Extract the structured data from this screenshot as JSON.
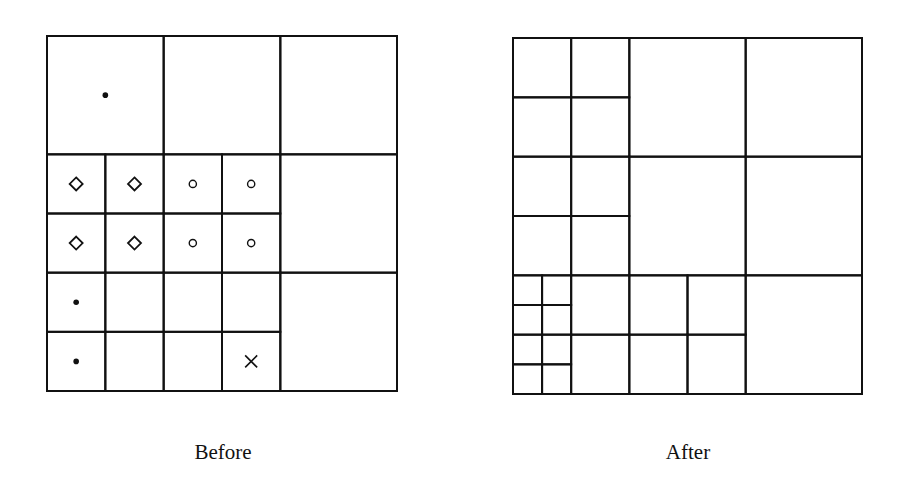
{
  "figure": {
    "panels": [
      {
        "id": "before",
        "caption": "Before",
        "frame": {
          "x": 47,
          "y": 36,
          "w": 350,
          "h": 355
        },
        "cells": [
          {
            "x": 0,
            "y": 0,
            "w": 2,
            "h": 2
          },
          {
            "x": 2,
            "y": 0,
            "w": 2,
            "h": 2
          },
          {
            "x": 4,
            "y": 0,
            "w": 2,
            "h": 2
          },
          {
            "x": 0,
            "y": 2,
            "w": 1,
            "h": 1
          },
          {
            "x": 1,
            "y": 2,
            "w": 1,
            "h": 1
          },
          {
            "x": 2,
            "y": 2,
            "w": 1,
            "h": 1
          },
          {
            "x": 3,
            "y": 2,
            "w": 1,
            "h": 1
          },
          {
            "x": 0,
            "y": 3,
            "w": 1,
            "h": 1
          },
          {
            "x": 1,
            "y": 3,
            "w": 1,
            "h": 1
          },
          {
            "x": 2,
            "y": 3,
            "w": 1,
            "h": 1
          },
          {
            "x": 3,
            "y": 3,
            "w": 1,
            "h": 1
          },
          {
            "x": 4,
            "y": 2,
            "w": 2,
            "h": 2
          },
          {
            "x": 0,
            "y": 4,
            "w": 1,
            "h": 1
          },
          {
            "x": 1,
            "y": 4,
            "w": 1,
            "h": 1
          },
          {
            "x": 2,
            "y": 4,
            "w": 1,
            "h": 1
          },
          {
            "x": 3,
            "y": 4,
            "w": 1,
            "h": 1
          },
          {
            "x": 0,
            "y": 5,
            "w": 1,
            "h": 1
          },
          {
            "x": 1,
            "y": 5,
            "w": 1,
            "h": 1
          },
          {
            "x": 2,
            "y": 5,
            "w": 1,
            "h": 1
          },
          {
            "x": 3,
            "y": 5,
            "w": 1,
            "h": 1
          },
          {
            "x": 4,
            "y": 4,
            "w": 2,
            "h": 2
          }
        ],
        "grid_units": 6,
        "markers": [
          {
            "cx": 1.0,
            "cy": 1.0,
            "shape": "dot"
          },
          {
            "cx": 0.5,
            "cy": 2.5,
            "shape": "diamond"
          },
          {
            "cx": 1.5,
            "cy": 2.5,
            "shape": "diamond"
          },
          {
            "cx": 2.5,
            "cy": 2.5,
            "shape": "circle"
          },
          {
            "cx": 3.5,
            "cy": 2.5,
            "shape": "circle"
          },
          {
            "cx": 0.5,
            "cy": 3.5,
            "shape": "diamond"
          },
          {
            "cx": 1.5,
            "cy": 3.5,
            "shape": "diamond"
          },
          {
            "cx": 2.5,
            "cy": 3.5,
            "shape": "circle"
          },
          {
            "cx": 3.5,
            "cy": 3.5,
            "shape": "circle"
          },
          {
            "cx": 0.5,
            "cy": 4.5,
            "shape": "dot"
          },
          {
            "cx": 0.5,
            "cy": 5.5,
            "shape": "dot"
          },
          {
            "cx": 3.5,
            "cy": 5.5,
            "shape": "cross"
          }
        ]
      },
      {
        "id": "after",
        "caption": "After",
        "frame": {
          "x": 513,
          "y": 38,
          "w": 349,
          "h": 356
        },
        "grid_units": 12,
        "cells": [
          {
            "x": 0,
            "y": 0,
            "w": 2,
            "h": 2
          },
          {
            "x": 2,
            "y": 0,
            "w": 2,
            "h": 2
          },
          {
            "x": 0,
            "y": 2,
            "w": 2,
            "h": 2
          },
          {
            "x": 2,
            "y": 2,
            "w": 2,
            "h": 2
          },
          {
            "x": 4,
            "y": 0,
            "w": 4,
            "h": 4
          },
          {
            "x": 8,
            "y": 0,
            "w": 4,
            "h": 4
          },
          {
            "x": 0,
            "y": 4,
            "w": 2,
            "h": 2
          },
          {
            "x": 2,
            "y": 4,
            "w": 2,
            "h": 2
          },
          {
            "x": 0,
            "y": 6,
            "w": 2,
            "h": 2
          },
          {
            "x": 2,
            "y": 6,
            "w": 2,
            "h": 2
          },
          {
            "x": 4,
            "y": 4,
            "w": 4,
            "h": 4
          },
          {
            "x": 8,
            "y": 4,
            "w": 4,
            "h": 4
          },
          {
            "x": 0,
            "y": 8,
            "w": 1,
            "h": 1
          },
          {
            "x": 1,
            "y": 8,
            "w": 1,
            "h": 1
          },
          {
            "x": 0,
            "y": 9,
            "w": 1,
            "h": 1
          },
          {
            "x": 1,
            "y": 9,
            "w": 1,
            "h": 1
          },
          {
            "x": 0,
            "y": 10,
            "w": 1,
            "h": 1
          },
          {
            "x": 1,
            "y": 10,
            "w": 1,
            "h": 1
          },
          {
            "x": 0,
            "y": 11,
            "w": 1,
            "h": 1
          },
          {
            "x": 1,
            "y": 11,
            "w": 1,
            "h": 1
          },
          {
            "x": 2,
            "y": 8,
            "w": 2,
            "h": 2
          },
          {
            "x": 2,
            "y": 10,
            "w": 2,
            "h": 2
          },
          {
            "x": 4,
            "y": 8,
            "w": 2,
            "h": 2
          },
          {
            "x": 6,
            "y": 8,
            "w": 2,
            "h": 2
          },
          {
            "x": 4,
            "y": 10,
            "w": 2,
            "h": 2
          },
          {
            "x": 6,
            "y": 10,
            "w": 2,
            "h": 2
          },
          {
            "x": 8,
            "y": 8,
            "w": 4,
            "h": 4
          }
        ],
        "markers": []
      }
    ]
  },
  "style": {
    "line_color": "#111111",
    "line_width": 2,
    "background": "#ffffff"
  }
}
